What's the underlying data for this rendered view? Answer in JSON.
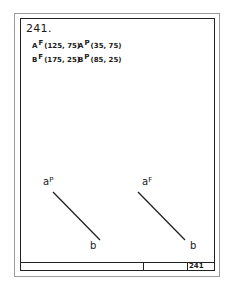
{
  "problem_number": "241.",
  "coordinates": [
    {
      "point": "A",
      "view": "F",
      "value": "(125, 75)"
    },
    {
      "point": "A",
      "view": "P",
      "value": "(35, 75)"
    },
    {
      "point": "B",
      "view": "F",
      "value": "(175, 25)"
    },
    {
      "point": "B",
      "view": "P",
      "value": "(85, 25)"
    }
  ],
  "views": {
    "profile": {
      "start_label": "a",
      "start_sup": "P",
      "end_label": "b"
    },
    "frontal": {
      "start_label": "a",
      "start_sup": "F",
      "end_label": "b"
    }
  },
  "title_block": {
    "page_number": "241"
  }
}
